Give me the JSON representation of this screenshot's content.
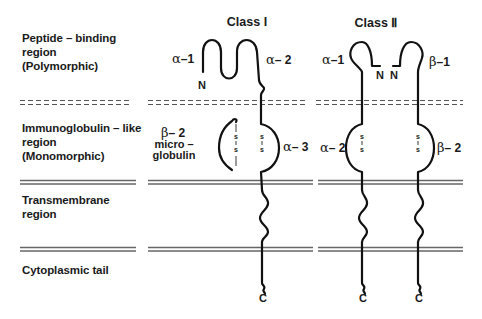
{
  "regions": [
    {
      "id": "peptide-binding",
      "lines": [
        "Peptide – binding",
        "region",
        "(Polymorphic)"
      ]
    },
    {
      "id": "immunoglobulin-like",
      "lines": [
        "Immunoglobulin – like",
        "region",
        "(Monomorphic)"
      ]
    },
    {
      "id": "transmembrane",
      "lines": [
        "Transmembrane",
        "region"
      ]
    },
    {
      "id": "cytoplasmic",
      "lines": [
        "Cytoplasmic  tail"
      ]
    }
  ],
  "class_i": {
    "title": "Class  I",
    "domains": {
      "alpha1": {
        "greek": "α",
        "num": "–1"
      },
      "alpha2": {
        "greek": "α",
        "num": "– 2"
      },
      "alpha3": {
        "greek": "α",
        "num": "– 3"
      }
    },
    "b2m": {
      "greek": "β",
      "num": "– 2",
      "line2": "micro –",
      "line3": "globulin"
    },
    "n_terminus": "N",
    "c_terminus": "C",
    "disulfide": [
      "s",
      "s"
    ]
  },
  "class_ii": {
    "title": "Class  Ⅱ",
    "alpha_chain": {
      "alpha1": {
        "greek": "α",
        "num": "–1"
      },
      "alpha2": {
        "greek": "α",
        "num": "– 2"
      },
      "n_terminus": "N",
      "c_terminus": "C"
    },
    "beta_chain": {
      "beta1": {
        "greek": "β",
        "num": "–1"
      },
      "beta2": {
        "greek": "β",
        "num": "– 2"
      },
      "n_terminus": "N",
      "c_terminus": "C"
    },
    "disulfide": [
      "s",
      "s"
    ]
  }
}
